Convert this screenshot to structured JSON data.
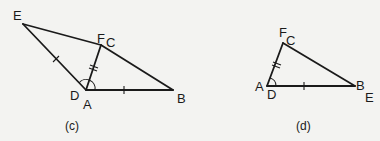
{
  "figures": [
    {
      "caption": "(c)",
      "labels": {
        "E": "E",
        "F": "F",
        "C": "C",
        "D": "D",
        "A": "A",
        "B": "B"
      },
      "description": "Triangle DEF overlaid on triangle ABC with D on A and F on C; ED marked single tick, AB single tick, AC/DF double tick, angle at A marked"
    },
    {
      "caption": "(d)",
      "labels": {
        "F": "F",
        "C": "C",
        "A": "A",
        "D": "D",
        "B": "B",
        "E": "E"
      },
      "description": "Triangles coincide: A on D, C on F, B on E; AC double tick, AB single tick, angle at A marked"
    }
  ],
  "colors": {
    "background": "#f3f3f1",
    "ink": "#1a1a1a"
  }
}
